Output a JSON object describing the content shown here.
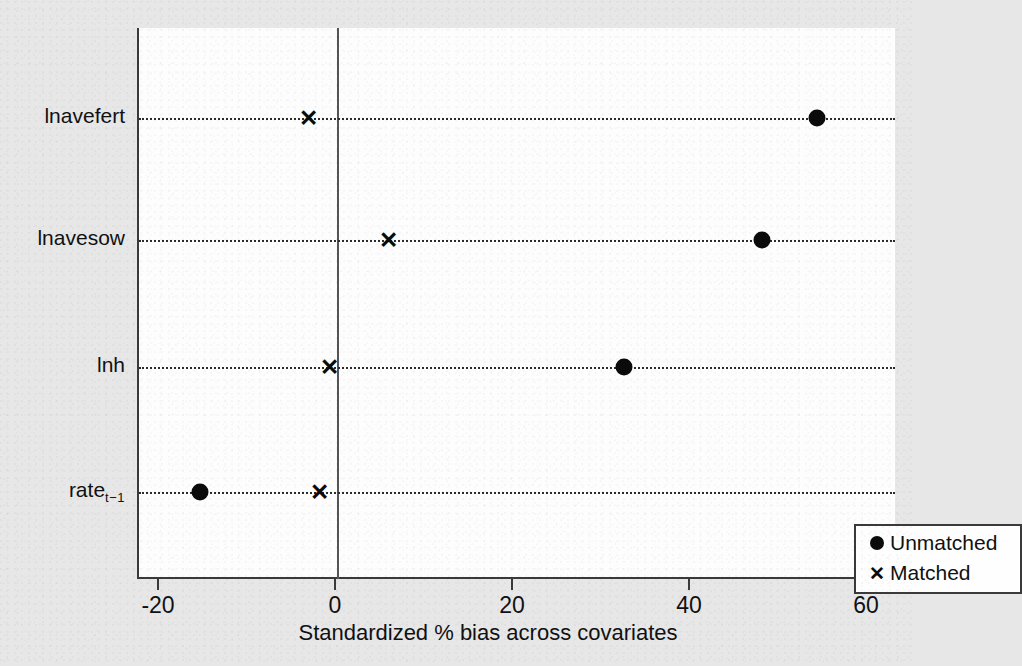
{
  "chart_data": {
    "type": "scatter",
    "title": "",
    "subtitle": "",
    "xlabel": "Standardized % bias across covariates",
    "ylabel": "",
    "xlim": [
      -26,
      63
    ],
    "xticks": [
      -20,
      0,
      20,
      40,
      60
    ],
    "xticklabels": [
      "-20",
      "0",
      "20",
      "40",
      "60"
    ],
    "grid": "horizontal dotted reference line per covariate",
    "legend_position": "bottom-right (inside plot area)",
    "reference_line_x": 0,
    "categories": [
      "lnavefert",
      "lnavesow",
      "lnh",
      "rate"
    ],
    "category_labels": [
      {
        "text": "lnavefert",
        "sub": ""
      },
      {
        "text": "lnavesow",
        "sub": ""
      },
      {
        "text": "lnh",
        "sub": ""
      },
      {
        "text": "rate",
        "sub": "t−1"
      }
    ],
    "series": [
      {
        "name": "Unmatched",
        "marker": "filled-circle",
        "color": "#0b0b0b",
        "values": [
          54.2,
          48.0,
          32.4,
          -15.5
        ]
      },
      {
        "name": "Matched",
        "marker": "x",
        "color": "#0b0b0b",
        "values": [
          -3.2,
          5.8,
          -0.8,
          -2.0
        ]
      }
    ]
  },
  "axis": {
    "x_title": "Standardized % bias across covariates"
  },
  "legend": {
    "entries": [
      {
        "label": "Unmatched",
        "marker": "filled-circle-icon"
      },
      {
        "label": "Matched",
        "marker": "x-marker-icon"
      }
    ]
  },
  "colors": {
    "background": "#e7e7e7",
    "plot_background": "#fdfdfd",
    "axis": "#3a3a3a",
    "marker": "#0b0b0b",
    "dotted_line": "#2b2b2b"
  }
}
